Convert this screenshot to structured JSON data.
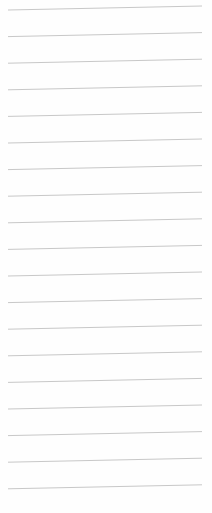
{
  "paper": {
    "type": "lined-paper",
    "line_count": 19,
    "line_color": "#c8c8c8",
    "background_color": "#fefefe",
    "first_line_y": 10,
    "line_spacing": 26.6,
    "line_x_start": 8,
    "line_x_end": 202,
    "slant_px": -4
  }
}
